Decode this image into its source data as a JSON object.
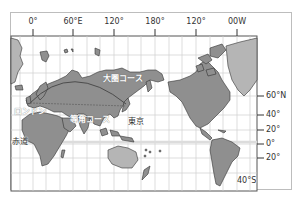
{
  "map": {
    "title": "",
    "longitude_labels": [
      {
        "label": "0°",
        "x": 33
      },
      {
        "label": "60°E",
        "x": 73
      },
      {
        "label": "120°",
        "x": 114
      },
      {
        "label": "180°",
        "x": 155
      },
      {
        "label": "120°",
        "x": 196
      },
      {
        "label": "00W",
        "x": 237
      }
    ],
    "latitude_labels": [
      {
        "label": "60°N",
        "y": 96
      },
      {
        "label": "40°",
        "y": 115
      },
      {
        "label": "20°",
        "y": 130
      },
      {
        "label": "0°",
        "y": 144
      },
      {
        "label": "20°",
        "y": 158
      }
    ],
    "annotations": {
      "great_circle": "大圏コース",
      "rhumb_line": "等角コース",
      "london": "ロンドン",
      "tokyo": "東京",
      "equator": "赤道",
      "south_40": "40°S"
    },
    "colors": {
      "land": "#8f8f8f",
      "land_light": "#b5b5b5",
      "grid": "#c8c8c8",
      "frame": "#555555",
      "route": "#444444"
    }
  }
}
